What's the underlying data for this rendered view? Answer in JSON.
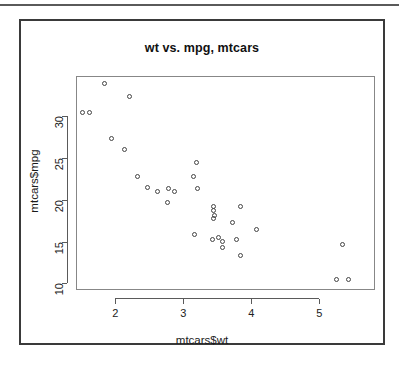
{
  "chart_data": {
    "type": "scatter",
    "title": "wt vs. mpg, mtcars",
    "xlabel": "mtcars$wt",
    "ylabel": "mtcars$mpg",
    "grid": false,
    "legend": false,
    "xlim": [
      1.42,
      5.82
    ],
    "ylim": [
      9.2,
      34.8
    ],
    "xticks": [
      2,
      3,
      4,
      5
    ],
    "yticks": [
      10,
      15,
      20,
      25,
      30
    ],
    "xtick_labels": [
      "2",
      "3",
      "4",
      "5"
    ],
    "ytick_labels": [
      "10",
      "15",
      "20",
      "25",
      "30"
    ],
    "marker": "open-circle",
    "marker_color": "#444444",
    "n_points": 32,
    "x": [
      2.62,
      2.875,
      2.32,
      3.215,
      3.44,
      3.46,
      3.57,
      3.19,
      3.15,
      3.44,
      3.44,
      4.07,
      3.73,
      3.78,
      5.25,
      5.424,
      5.345,
      2.2,
      1.615,
      1.835,
      2.465,
      3.52,
      3.435,
      3.84,
      3.845,
      1.935,
      2.14,
      1.513,
      3.17,
      2.77,
      3.57,
      2.78
    ],
    "y": [
      21.0,
      21.0,
      22.8,
      21.4,
      18.7,
      18.1,
      14.3,
      24.4,
      22.8,
      19.2,
      17.8,
      16.4,
      17.3,
      15.2,
      10.4,
      10.4,
      14.7,
      32.4,
      30.4,
      33.9,
      21.5,
      15.5,
      15.2,
      13.3,
      19.2,
      27.3,
      26.0,
      30.4,
      15.8,
      19.7,
      15.0,
      21.4
    ]
  },
  "figure": {
    "title": "wt vs. mpg, mtcars",
    "x_axis_label": "mtcars$wt",
    "y_axis_label": "mtcars$mpg"
  }
}
